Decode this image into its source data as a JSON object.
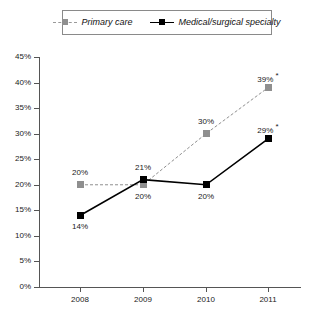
{
  "chart_data": {
    "type": "line",
    "title": "",
    "subtitle": "",
    "xlabel": "",
    "ylabel": "",
    "categories": [
      "2008",
      "2009",
      "2010",
      "2011"
    ],
    "x": [
      2008,
      2009,
      2010,
      2011
    ],
    "ylim": [
      0,
      45
    ],
    "ytick_labels": [
      "45%",
      "40%",
      "35%",
      "30%",
      "25%",
      "20%",
      "15%",
      "10%",
      "5%",
      "0%"
    ],
    "ytick_values": [
      45,
      40,
      35,
      30,
      25,
      20,
      15,
      10,
      5,
      0
    ],
    "grid": false,
    "legend_position": "top-center",
    "series": [
      {
        "name": "Primary care",
        "color": "#8f8f8f",
        "line_style": "dashed",
        "marker": "square",
        "values": [
          20,
          20,
          30,
          39
        ],
        "point_labels": [
          "20%",
          "20%",
          "30%",
          "39%"
        ],
        "point_label_stars": [
          "",
          "",
          "",
          "*"
        ],
        "point_label_positions": [
          "above",
          "below",
          "above",
          "above"
        ]
      },
      {
        "name": "Medical/surgical specialty",
        "color": "#000000",
        "line_style": "solid",
        "marker": "square",
        "values": [
          14,
          21,
          20,
          29
        ],
        "point_labels": [
          "14%",
          "21%",
          "20%",
          "29%"
        ],
        "point_label_stars": [
          "",
          "",
          "",
          "*"
        ],
        "point_label_positions": [
          "below",
          "above",
          "below",
          "above"
        ]
      }
    ]
  },
  "legend": {
    "entries": [
      {
        "label": "Primary care",
        "key": "gray-dashed-square-key"
      },
      {
        "label": "Medical/surgical specialty",
        "key": "black-solid-square-key"
      }
    ]
  },
  "axes": {
    "y_labels": [
      "45%",
      "40%",
      "35%",
      "30%",
      "25%",
      "20%",
      "15%",
      "10%",
      "5%",
      "0%"
    ],
    "x_labels": [
      "2008",
      "2009",
      "2010",
      "2011"
    ]
  },
  "colors": {
    "primary_care": "#8f8f8f",
    "medical_surgical": "#000000",
    "axis": "#555555",
    "background": "#ffffff"
  }
}
